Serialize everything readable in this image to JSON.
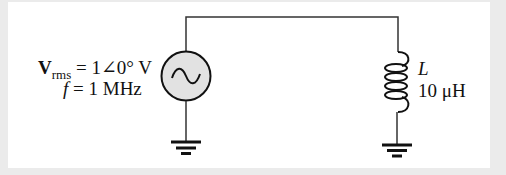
{
  "diagram": {
    "type": "circuit",
    "source": {
      "kind": "ac-voltage-source",
      "voltage_symbol": "V",
      "voltage_subscript": "rms",
      "voltage_value": "= 1∠0° V",
      "frequency_symbol": "f",
      "frequency_value": "= 1 MHz"
    },
    "inductor": {
      "kind": "inductor",
      "symbol": "L",
      "value": "10 μH"
    },
    "grounds": [
      "source-ground",
      "inductor-ground"
    ],
    "colors": {
      "wire": "#333333",
      "source_fill": "#e2e2e2",
      "background": "#ebebeb",
      "panel": "#ffffff"
    }
  }
}
